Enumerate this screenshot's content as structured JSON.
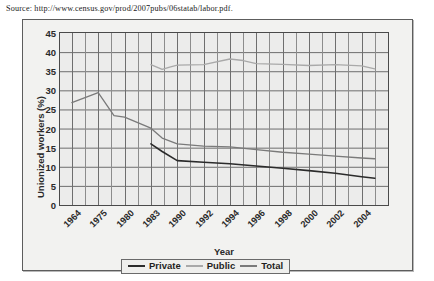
{
  "source": {
    "text": "Source: http://www.census.gov/prod/2007pubs/06statab/labor.pdf."
  },
  "legend": {
    "position": "bottom-center",
    "items": [
      {
        "label": "Private",
        "color": "#2b2b2b"
      },
      {
        "label": "Public",
        "color": "#a9a9a9"
      },
      {
        "label": "Total",
        "color": "#7a7a7a"
      }
    ]
  },
  "chart_data": {
    "type": "line",
    "title": "",
    "xlabel": "Year",
    "ylabel": "Unionized workers (%)",
    "ylim": [
      0,
      45
    ],
    "yticks": [
      0,
      5,
      10,
      15,
      20,
      25,
      30,
      35,
      40,
      45
    ],
    "grid": true,
    "x": [
      1964,
      1975,
      1980,
      1983,
      1990,
      1992,
      1994,
      1996,
      1998,
      2000,
      2002,
      2004
    ],
    "categories": [
      "1964",
      "1975",
      "1980",
      "1983",
      "1990",
      "1992",
      "1994",
      "1996",
      "1998",
      "2000",
      "2002",
      "2004"
    ],
    "xtick_labels": [
      "1964",
      "1975",
      "1980",
      "1983",
      "1990",
      "1992",
      "1994",
      "1996",
      "1998",
      "2000",
      "2002",
      "2004"
    ],
    "series": [
      {
        "name": "Private",
        "color": "#2b2b2b",
        "points": [
          {
            "x": 1983,
            "y": 16.0
          },
          {
            "x": 1986,
            "y": 14.0
          },
          {
            "x": 1990,
            "y": 11.6
          },
          {
            "x": 1992,
            "y": 11.2
          },
          {
            "x": 1994,
            "y": 10.8
          },
          {
            "x": 1996,
            "y": 10.2
          },
          {
            "x": 1998,
            "y": 9.6
          },
          {
            "x": 2000,
            "y": 9.0
          },
          {
            "x": 2002,
            "y": 8.3
          },
          {
            "x": 2004,
            "y": 7.4
          },
          {
            "x": 2005,
            "y": 7.0
          }
        ]
      },
      {
        "name": "Public",
        "color": "#a9a9a9",
        "points": [
          {
            "x": 1983,
            "y": 36.7
          },
          {
            "x": 1986,
            "y": 35.5
          },
          {
            "x": 1988,
            "y": 36.1
          },
          {
            "x": 1990,
            "y": 36.6
          },
          {
            "x": 1992,
            "y": 36.7
          },
          {
            "x": 1994,
            "y": 38.2
          },
          {
            "x": 1995,
            "y": 37.8
          },
          {
            "x": 1996,
            "y": 37.0
          },
          {
            "x": 1998,
            "y": 36.8
          },
          {
            "x": 2000,
            "y": 36.5
          },
          {
            "x": 2002,
            "y": 36.7
          },
          {
            "x": 2004,
            "y": 36.4
          },
          {
            "x": 2005,
            "y": 35.6
          }
        ]
      },
      {
        "name": "Total",
        "color": "#7a7a7a",
        "points": [
          {
            "x": 1964,
            "y": 26.8
          },
          {
            "x": 1975,
            "y": 29.4
          },
          {
            "x": 1978,
            "y": 23.4
          },
          {
            "x": 1980,
            "y": 23.0
          },
          {
            "x": 1983,
            "y": 20.1
          },
          {
            "x": 1986,
            "y": 17.5
          },
          {
            "x": 1990,
            "y": 16.0
          },
          {
            "x": 1992,
            "y": 15.4
          },
          {
            "x": 1994,
            "y": 15.2
          },
          {
            "x": 1996,
            "y": 14.5
          },
          {
            "x": 1998,
            "y": 13.8
          },
          {
            "x": 2000,
            "y": 13.3
          },
          {
            "x": 2002,
            "y": 12.8
          },
          {
            "x": 2004,
            "y": 12.3
          },
          {
            "x": 2005,
            "y": 12.1
          }
        ]
      }
    ]
  }
}
